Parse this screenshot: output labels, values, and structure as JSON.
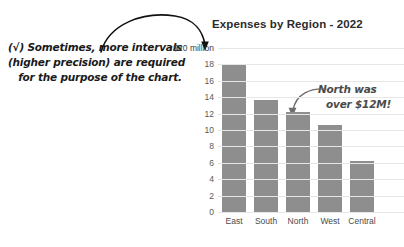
{
  "notes": {
    "left": {
      "name": "precision-note",
      "line1": "(√) Sometimes, more intervals",
      "line2": "(higher precision) are required",
      "line3": "for the purpose of the chart."
    },
    "north": {
      "name": "north-callout",
      "line1": "North was",
      "line2": "over $12M!"
    }
  },
  "arrows": {
    "top_arrow": "curved-arrow-to-axis-label",
    "north_arrow": "curved-arrow-to-north-bar"
  },
  "chart_data": {
    "type": "bar",
    "title": "Expenses by Region - 2022",
    "xlabel": "",
    "ylabel": "",
    "categories": [
      "East",
      "South",
      "North",
      "West",
      "Central"
    ],
    "values": [
      18.1,
      13.6,
      12.2,
      10.6,
      6.2
    ],
    "ylim": [
      0,
      20
    ],
    "ytick_values": [
      0,
      2,
      4,
      6,
      8,
      10,
      12,
      14,
      16,
      18,
      20
    ],
    "ytick_labels": [
      "0",
      "2",
      "4",
      "6",
      "8",
      "10",
      "12",
      "14",
      "16",
      "18",
      "$20 million"
    ],
    "grid": true,
    "legend": false,
    "bar_color": "#8e8e8e",
    "grid_color": "#e6e6e6",
    "title_color": "#2b2b2b"
  }
}
